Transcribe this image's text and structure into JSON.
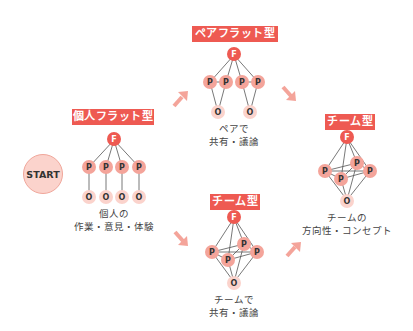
{
  "start": {
    "label": "START"
  },
  "stages": {
    "individual_flat": {
      "title": "個人フラット型",
      "caption_line1": "個人の",
      "caption_line2": "作業・意見・体験"
    },
    "pair_flat": {
      "title": "ペアフラット型",
      "caption_line1": "ペアで",
      "caption_line2": "共有・議論"
    },
    "team_bottom": {
      "title": "チーム型",
      "caption_line1": "チームで",
      "caption_line2": "共有・議論"
    },
    "team_right": {
      "title": "チーム型",
      "caption_line1": "チームの",
      "caption_line2": "方向性・コンセプト"
    }
  },
  "node_labels": {
    "facilitator": "F",
    "participant": "P",
    "output": "O"
  },
  "colors": {
    "label_bg": "#ee5a52",
    "node_f": "#ee5a52",
    "node_p": "#f4a49a",
    "node_o": "#fbd3cc",
    "arrow": "#f4a49a",
    "line": "#555555"
  }
}
